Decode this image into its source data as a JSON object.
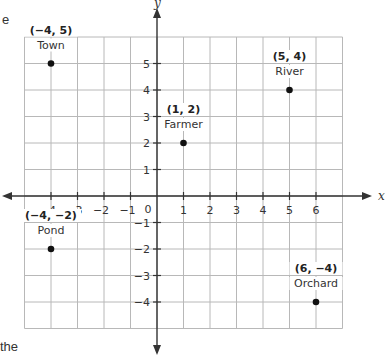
{
  "fragments": {
    "top_left": "e",
    "bottom_left": "the"
  },
  "axes": {
    "x_label": "x",
    "y_label": "y",
    "origin_label": "0",
    "x_ticks": [
      -4,
      -3,
      -2,
      -1,
      1,
      2,
      3,
      4,
      5,
      6
    ],
    "y_ticks": [
      5,
      4,
      3,
      2,
      1,
      -1,
      -2,
      -3,
      -4
    ],
    "grid_x_range": [
      -5,
      7
    ],
    "grid_y_range": [
      -5,
      6
    ]
  },
  "points": [
    {
      "name": "Town",
      "x": -4,
      "y": 5,
      "coord": "(−4, 5)"
    },
    {
      "name": "Farmer",
      "x": 1,
      "y": 2,
      "coord": "(1, 2)"
    },
    {
      "name": "River",
      "x": 5,
      "y": 4,
      "coord": "(5, 4)"
    },
    {
      "name": "Pond",
      "x": -4,
      "y": -2,
      "coord": "(−4, −2)"
    },
    {
      "name": "Orchard",
      "x": 6,
      "y": -4,
      "coord": "(6, −4)"
    }
  ],
  "colors": {
    "grid": "#b8b8b8",
    "axis": "#333333",
    "point": "#111111"
  },
  "chart_data": {
    "type": "scatter",
    "title": "",
    "xlabel": "x",
    "ylabel": "y",
    "xlim": [
      -5,
      7
    ],
    "ylim": [
      -5,
      6
    ],
    "grid": true,
    "series": [
      {
        "name": "Locations",
        "points": [
          {
            "label": "Town",
            "x": -4,
            "y": 5
          },
          {
            "label": "Farmer",
            "x": 1,
            "y": 2
          },
          {
            "label": "River",
            "x": 5,
            "y": 4
          },
          {
            "label": "Pond",
            "x": -4,
            "y": -2
          },
          {
            "label": "Orchard",
            "x": 6,
            "y": -4
          }
        ]
      }
    ]
  }
}
